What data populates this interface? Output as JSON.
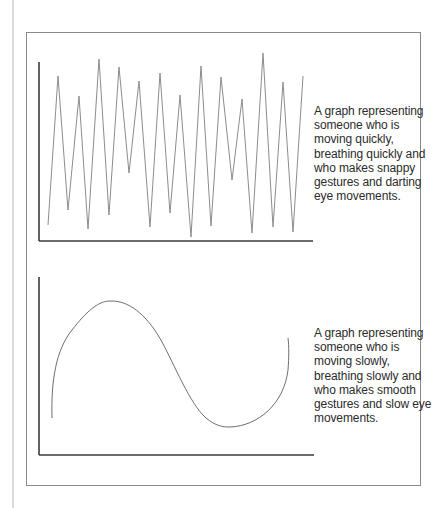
{
  "figure": {
    "top_caption": "A graph representing someone who is moving quickly, breathing quickly and who makes snappy gestures and darting eye movements.",
    "bottom_caption": "A graph representing someone who is moving slowly, breathing slowly and who makes smooth gestures and slow eye movements.",
    "colors": {
      "axis": "#3a3a3a",
      "line": "#8c8c8c",
      "frame": "#8a8a8a",
      "text": "#2b2b2b"
    }
  },
  "chart_data": [
    {
      "type": "line",
      "title": "",
      "xlabel": "",
      "ylabel": "",
      "description": "Jagged zig-zag line: fast, snappy movement",
      "series": [
        {
          "name": "quick",
          "shape": "zigzag",
          "points": [
            [
              48,
              225
            ],
            [
              58,
              76
            ],
            [
              68,
              210
            ],
            [
              79,
              96
            ],
            [
              88,
              229
            ],
            [
              99,
              59
            ],
            [
              109,
              215
            ],
            [
              119,
              67
            ],
            [
              129,
              173
            ],
            [
              139,
              81
            ],
            [
              150,
              227
            ],
            [
              160,
              73
            ],
            [
              170,
              213
            ],
            [
              180,
              95
            ],
            [
              191,
              237
            ],
            [
              201,
              66
            ],
            [
              211,
              226
            ],
            [
              221,
              77
            ],
            [
              232,
              180
            ],
            [
              242,
              99
            ],
            [
              252,
              233
            ],
            [
              263,
              53
            ],
            [
              273,
              227
            ],
            [
              283,
              82
            ],
            [
              293,
              232
            ],
            [
              303,
              76
            ]
          ]
        }
      ],
      "grid": false
    },
    {
      "type": "line",
      "title": "",
      "xlabel": "",
      "ylabel": "",
      "description": "Smooth single sine-like wave: slow, smooth movement",
      "series": [
        {
          "name": "slow",
          "shape": "smooth-wave",
          "points": [
            [
              52,
              418
            ],
            [
              110,
              301
            ],
            [
              170,
              357
            ],
            [
              225,
              426
            ],
            [
              288,
              338
            ]
          ]
        }
      ],
      "grid": false
    }
  ]
}
